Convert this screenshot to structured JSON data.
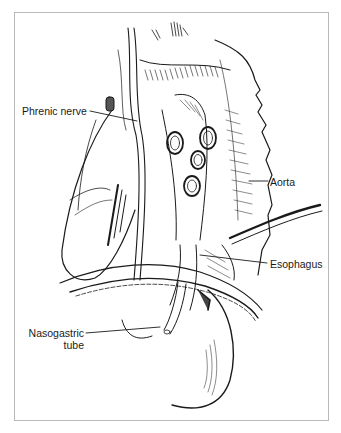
{
  "figure": {
    "type": "anatomical line illustration",
    "frame_color": "#b8b8b8",
    "line_color": "#1a1a1a",
    "labels": [
      {
        "id": "phrenic",
        "text": "Phrenic nerve"
      },
      {
        "id": "aorta",
        "text": "Aorta"
      },
      {
        "id": "esophagus",
        "text": "Esophagus"
      },
      {
        "id": "nasogastric_line1",
        "text": "Nasogastric"
      },
      {
        "id": "nasogastric_line2",
        "text": "tube"
      }
    ]
  }
}
